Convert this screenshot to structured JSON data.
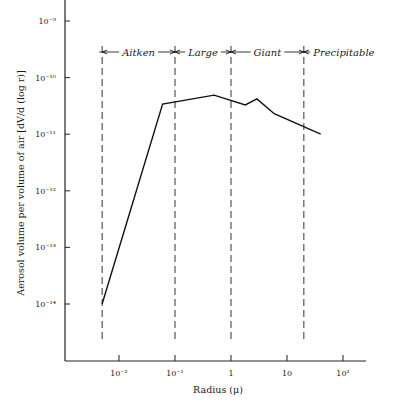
{
  "chart_data": {
    "type": "line",
    "title": "",
    "xlabel": "Radius (μ)",
    "ylabel": "Aerosol volume per volume of air [dV/d (log r)]",
    "xscale": "log",
    "yscale": "log",
    "xlim": [
      0.0015,
      300
    ],
    "ylim": [
      1e-15,
      1.5e-09
    ],
    "grid": false,
    "x_ticks": [
      {
        "value": 0.01,
        "label": "10⁻²"
      },
      {
        "value": 0.1,
        "label": "10⁻¹"
      },
      {
        "value": 1,
        "label": "1"
      },
      {
        "value": 10,
        "label": "10"
      },
      {
        "value": 100,
        "label": "10²"
      }
    ],
    "y_ticks": [
      {
        "value": 1e-09,
        "label": "10⁻⁹"
      },
      {
        "value": 1e-10,
        "label": "10⁻¹⁰"
      },
      {
        "value": 1e-11,
        "label": "10⁻¹¹"
      },
      {
        "value": 1e-12,
        "label": "10⁻¹²"
      },
      {
        "value": 1e-13,
        "label": "10⁻¹³"
      },
      {
        "value": 1e-14,
        "label": "10⁻¹⁴"
      }
    ],
    "series": [
      {
        "name": "Aerosol volume distribution",
        "x": [
          0.005,
          0.06,
          0.5,
          1.8,
          2.9,
          5.9,
          40
        ],
        "y": [
          1e-14,
          3.4e-11,
          4.9e-11,
          3.3e-11,
          4.2e-11,
          2.3e-11,
          1e-11
        ]
      }
    ],
    "regions": [
      {
        "label": "Aitken",
        "from": 0.005,
        "to": 0.1
      },
      {
        "label": "Large",
        "from": 0.1,
        "to": 1
      },
      {
        "label": "Giant",
        "from": 1,
        "to": 20
      },
      {
        "label": "Precipitable",
        "from": 20,
        "to": null
      }
    ],
    "region_boundaries": [
      0.005,
      0.1,
      1,
      20
    ]
  }
}
